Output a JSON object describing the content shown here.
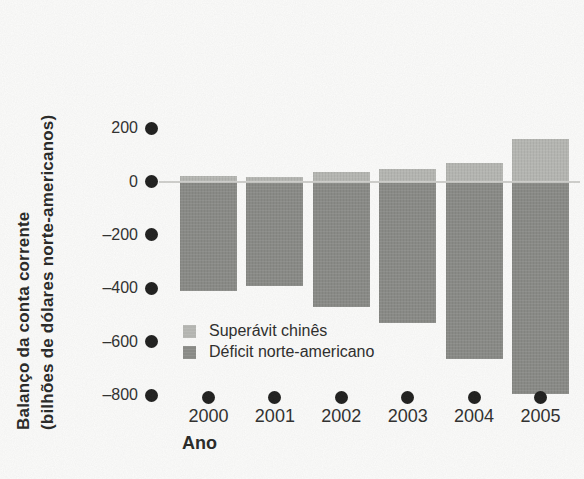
{
  "figure": {
    "y_axis_title_line1": "Balanço da conta corrente",
    "y_axis_title_line2": "(bilhões de dólares norte-americanos)",
    "x_axis_title": "Ano"
  },
  "legend": {
    "items": [
      {
        "label": "Superávit chinês",
        "color": "#b6b7b3"
      },
      {
        "label": "Déficit norte-americano",
        "color": "#898a86"
      }
    ]
  },
  "chart_data": {
    "type": "bar",
    "categories": [
      "2000",
      "2001",
      "2002",
      "2003",
      "2004",
      "2005"
    ],
    "series": [
      {
        "name": "Superávit chinês",
        "color": "#b6b7b3",
        "values": [
          20,
          18,
          35,
          47,
          70,
          158
        ]
      },
      {
        "name": "Déficit norte-americano",
        "color": "#898a86",
        "values": [
          -410,
          -390,
          -470,
          -530,
          -665,
          -795
        ]
      }
    ],
    "title": "",
    "xlabel": "Ano",
    "ylabel": "Balanço da conta corrente (bilhões de dólares norte-americanos)",
    "y_ticks": [
      200,
      0,
      -200,
      -400,
      -600,
      -800
    ],
    "y_tick_labels": [
      "200",
      "0",
      "–200",
      "–400",
      "–600",
      "–800"
    ],
    "ylim": [
      -860,
      260
    ],
    "grid": false,
    "zero_line": true,
    "axis_marker_style": "filled-dot-ticks",
    "legend_position": "inside-bottom-left"
  },
  "style": {
    "background": "#fcfcfb",
    "text_color": "#2e2e2d",
    "bullet_color": "#1e1e1d",
    "zero_line_color": "#cbcbc8",
    "bar_light": "#b6b7b3",
    "bar_dark": "#898a86"
  }
}
